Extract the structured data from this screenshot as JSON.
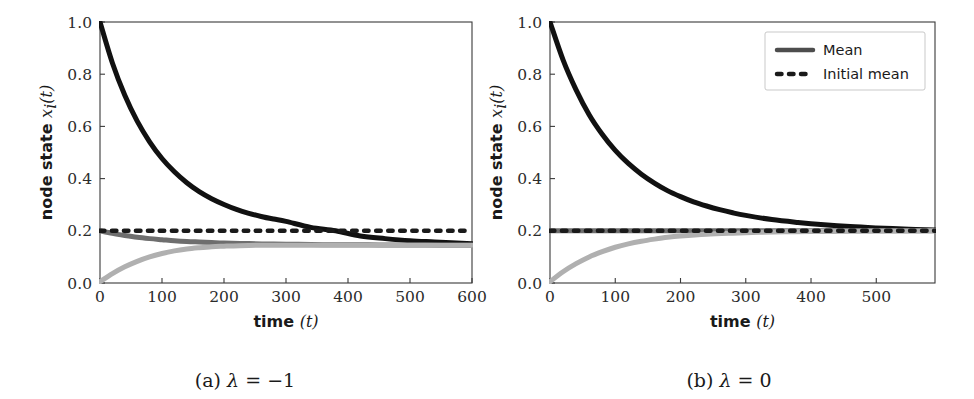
{
  "figure": {
    "panels": [
      {
        "id": "a",
        "caption_prefix": "(a)",
        "caption_symbol": "λ",
        "caption_relation": "=",
        "caption_value": "−1",
        "caption_full": "(a) λ = −1"
      },
      {
        "id": "b",
        "caption_prefix": "(b)",
        "caption_symbol": "λ",
        "caption_relation": "=",
        "caption_value": "0",
        "caption_full": "(b) λ = 0"
      }
    ]
  },
  "legend": {
    "position": "upper right",
    "items": [
      {
        "label": "Mean",
        "style": "solid",
        "color": "#4d4d4d"
      },
      {
        "label": "Initial mean",
        "style": "dotted",
        "color": "#1a1a1a"
      }
    ]
  },
  "colors": {
    "curve_high": "#111111",
    "curve_mid": "#6e6e6e",
    "curve_low": "#b0b0b0",
    "dotted": "#1a1a1a",
    "axis": "#3a3a3a",
    "background": "#ffffff"
  },
  "chart_data": [
    {
      "type": "line",
      "panel": "a",
      "title": "(a) λ = −1",
      "xlabel": "time (t)",
      "ylabel": "node state x_i(t)",
      "xlim": [
        0,
        600
      ],
      "ylim": [
        0.0,
        1.0
      ],
      "xticks": [
        0,
        100,
        200,
        300,
        400,
        500,
        600
      ],
      "xticklabels": [
        "0",
        "100",
        "200",
        "300",
        "400",
        "500",
        "600"
      ],
      "yticks": [
        0.0,
        0.2,
        0.4,
        0.6,
        0.8,
        1.0
      ],
      "yticklabels": [
        "0.0",
        "0.2",
        "0.4",
        "0.6",
        "0.8",
        "1.0"
      ],
      "grid": false,
      "legend": false,
      "series": [
        {
          "name": "node starting high",
          "style": "solid",
          "color": "#111111",
          "linewidth": 5,
          "x": [
            0,
            20,
            40,
            60,
            80,
            100,
            120,
            140,
            160,
            180,
            200,
            220,
            240,
            260,
            280,
            300,
            340,
            380,
            420,
            460,
            500,
            540,
            600
          ],
          "y": [
            1.0,
            0.843,
            0.719,
            0.62,
            0.541,
            0.477,
            0.426,
            0.384,
            0.35,
            0.323,
            0.301,
            0.282,
            0.267,
            0.255,
            0.245,
            0.236,
            0.213,
            0.2,
            0.18,
            0.17,
            0.162,
            0.157,
            0.15
          ]
        },
        {
          "name": "mean",
          "style": "solid",
          "color": "#6e6e6e",
          "linewidth": 5,
          "x": [
            0,
            20,
            40,
            60,
            80,
            100,
            120,
            140,
            160,
            180,
            200,
            240,
            280,
            320,
            360,
            400,
            450,
            500,
            550,
            600
          ],
          "y": [
            0.2,
            0.19,
            0.182,
            0.175,
            0.17,
            0.166,
            0.162,
            0.159,
            0.157,
            0.155,
            0.153,
            0.151,
            0.149,
            0.148,
            0.147,
            0.147,
            0.146,
            0.146,
            0.145,
            0.145
          ]
        },
        {
          "name": "node starting low",
          "style": "solid",
          "color": "#b0b0b0",
          "linewidth": 5,
          "x": [
            0,
            20,
            40,
            60,
            80,
            100,
            120,
            140,
            160,
            180,
            200,
            240,
            280,
            320,
            360,
            400,
            450,
            500,
            550,
            600
          ],
          "y": [
            0.005,
            0.036,
            0.062,
            0.083,
            0.1,
            0.113,
            0.123,
            0.13,
            0.135,
            0.139,
            0.141,
            0.144,
            0.145,
            0.145,
            0.145,
            0.145,
            0.145,
            0.145,
            0.145,
            0.145
          ]
        },
        {
          "name": "Initial mean",
          "style": "dotted",
          "color": "#1a1a1a",
          "linewidth": 4.5,
          "x": [
            0,
            600
          ],
          "y": [
            0.2,
            0.2
          ]
        }
      ]
    },
    {
      "type": "line",
      "panel": "b",
      "title": "(b) λ = 0",
      "xlabel": "time (t)",
      "ylabel": "node state x_i(t)",
      "xlim": [
        0,
        590
      ],
      "ylim": [
        0.0,
        1.0
      ],
      "xticks": [
        0,
        100,
        200,
        300,
        400,
        500
      ],
      "xticklabels": [
        "0",
        "100",
        "200",
        "300",
        "400",
        "500"
      ],
      "yticks": [
        0.0,
        0.2,
        0.4,
        0.6,
        0.8,
        1.0
      ],
      "yticklabels": [
        "0.0",
        "0.2",
        "0.4",
        "0.6",
        "0.8",
        "1.0"
      ],
      "grid": false,
      "legend": true,
      "series": [
        {
          "name": "node starting high",
          "style": "solid",
          "color": "#111111",
          "linewidth": 5,
          "x": [
            0,
            20,
            40,
            60,
            80,
            100,
            120,
            140,
            160,
            180,
            200,
            220,
            240,
            260,
            280,
            300,
            340,
            380,
            420,
            460,
            500,
            550,
            590
          ],
          "y": [
            1.0,
            0.855,
            0.74,
            0.645,
            0.57,
            0.508,
            0.458,
            0.417,
            0.383,
            0.354,
            0.331,
            0.311,
            0.295,
            0.281,
            0.269,
            0.259,
            0.243,
            0.232,
            0.223,
            0.216,
            0.211,
            0.206,
            0.203
          ]
        },
        {
          "name": "mean",
          "style": "solid",
          "color": "#6e6e6e",
          "linewidth": 5,
          "x": [
            0,
            590
          ],
          "y": [
            0.2,
            0.2
          ]
        },
        {
          "name": "node starting low",
          "style": "solid",
          "color": "#b0b0b0",
          "linewidth": 5,
          "x": [
            0,
            20,
            40,
            60,
            80,
            100,
            120,
            140,
            160,
            180,
            200,
            240,
            280,
            320,
            360,
            400,
            450,
            500,
            550,
            590
          ],
          "y": [
            0.005,
            0.043,
            0.074,
            0.1,
            0.12,
            0.137,
            0.15,
            0.16,
            0.168,
            0.175,
            0.18,
            0.187,
            0.191,
            0.194,
            0.196,
            0.197,
            0.198,
            0.199,
            0.199,
            0.2
          ]
        },
        {
          "name": "Initial mean",
          "style": "dotted",
          "color": "#1a1a1a",
          "linewidth": 4.5,
          "x": [
            0,
            590
          ],
          "y": [
            0.2,
            0.2
          ]
        }
      ]
    }
  ]
}
